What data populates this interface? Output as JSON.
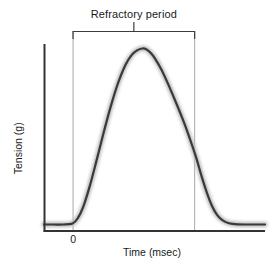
{
  "figure": {
    "width": 272,
    "height": 266,
    "background": "#ffffff"
  },
  "chart_data": {
    "type": "line",
    "title": "Refractory period",
    "xlabel": "Time (msec)",
    "ylabel": "Tension (g)",
    "grid": false,
    "legend": null,
    "axes": {
      "x_ticks": [
        "0"
      ],
      "x_tick_positions": [
        0
      ],
      "y_ticks": [],
      "xlim": [
        -1.35,
        9.1
      ],
      "ylim": [
        0,
        1.12
      ]
    },
    "series": [
      {
        "name": "Muscle twitch tension",
        "color": "#3a3a3a",
        "halo_color": "#bfbfbf",
        "x": [
          -1.35,
          -0.9,
          -0.45,
          0.0,
          0.25,
          0.5,
          0.8,
          1.1,
          1.45,
          1.8,
          2.15,
          2.5,
          2.8,
          3.05,
          3.3,
          3.5,
          3.7,
          3.9,
          4.2,
          4.5,
          4.85,
          5.2,
          5.55,
          5.85,
          6.1,
          6.35,
          6.6,
          6.85,
          7.1,
          7.4,
          7.8,
          8.3,
          9.1
        ],
        "y": [
          0.035,
          0.035,
          0.035,
          0.04,
          0.07,
          0.13,
          0.24,
          0.37,
          0.53,
          0.68,
          0.81,
          0.91,
          0.965,
          0.99,
          1.0,
          0.995,
          0.975,
          0.945,
          0.885,
          0.81,
          0.715,
          0.615,
          0.505,
          0.4,
          0.3,
          0.21,
          0.135,
          0.085,
          0.058,
          0.042,
          0.036,
          0.035,
          0.035
        ]
      }
    ],
    "annotations": [
      {
        "name": "refractory-period-bracket",
        "label": "Refractory period",
        "color": "#999999",
        "x_start": 0.0,
        "x_end": 5.75,
        "x_center": 2.875,
        "style": "bracket-with-center-tick"
      }
    ]
  },
  "labels": {
    "title": "Refractory period",
    "xaxis": "Time (msec)",
    "yaxis": "Tension (g)",
    "xtick_zero": "0"
  }
}
